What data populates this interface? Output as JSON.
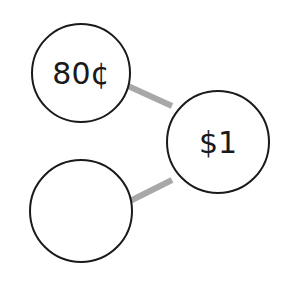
{
  "diagram": {
    "nodes": [
      {
        "id": "top-left",
        "label": "80¢",
        "cx": 81,
        "cy": 73,
        "r": 49
      },
      {
        "id": "right",
        "label": "$1",
        "cx": 218,
        "cy": 142,
        "r": 51
      },
      {
        "id": "bottom-left",
        "label": "",
        "cx": 81,
        "cy": 211,
        "r": 51
      }
    ],
    "edges": [
      {
        "from": "top-left",
        "to": "right"
      },
      {
        "from": "bottom-left",
        "to": "right"
      }
    ],
    "colors": {
      "stroke": "#1a1a1a",
      "edge": "#a8a8a8",
      "fill": "#ffffff"
    }
  }
}
